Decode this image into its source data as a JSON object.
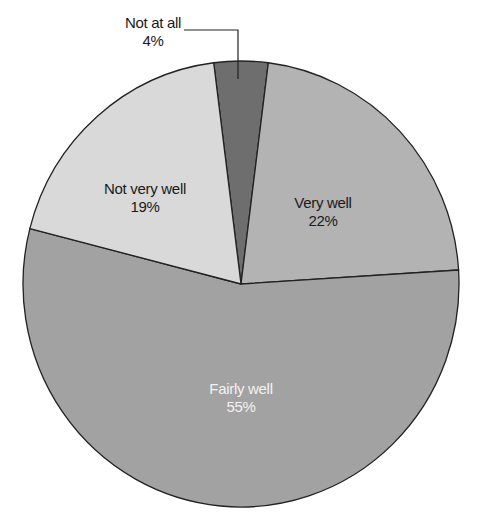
{
  "chart_data": {
    "type": "pie",
    "title": "",
    "slices": [
      {
        "label": "Not at all",
        "value": 4,
        "color": "#6e6e6e"
      },
      {
        "label": "Very well",
        "value": 22,
        "color": "#b3b3b3"
      },
      {
        "label": "Fairly well",
        "value": 55,
        "color": "#a2a2a2"
      },
      {
        "label": "Not very well",
        "value": 19,
        "color": "#d9d9d9"
      }
    ],
    "labels": {
      "not_at_all": {
        "name": "Not at all",
        "pct": "4%"
      },
      "very_well": {
        "name": "Very well",
        "pct": "22%"
      },
      "fairly_well": {
        "name": "Fairly well",
        "pct": "55%"
      },
      "not_very_well": {
        "name": "Not very well",
        "pct": "19%"
      }
    }
  }
}
